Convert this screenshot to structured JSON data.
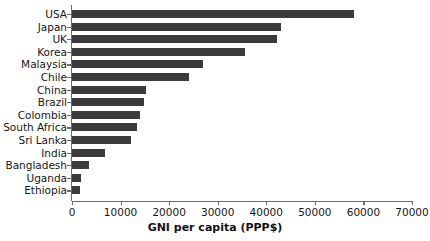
{
  "chart_data": {
    "type": "bar",
    "orientation": "horizontal",
    "title": "",
    "xlabel": "GNI per capita (PPP$)",
    "ylabel": "",
    "xlim": [
      0,
      70000
    ],
    "xticks": [
      0,
      10000,
      20000,
      30000,
      40000,
      50000,
      60000,
      70000
    ],
    "xtick_labels": [
      "0",
      "10000",
      "20000",
      "30000",
      "40000",
      "50000",
      "60000",
      "70000"
    ],
    "grid": false,
    "legend": false,
    "bar_color": "#3b3b3b",
    "axis_color": "#6b6b6b",
    "categories": [
      "USA",
      "Japan",
      "UK",
      "Korea",
      "Malaysia",
      "Chile",
      "China",
      "Brazil",
      "Colombia",
      "South Africa",
      "Sri Lanka",
      "India",
      "Bangladesh",
      "Uganda",
      "Ethiopia"
    ],
    "values": [
      58000,
      43000,
      42200,
      35600,
      27000,
      24000,
      15200,
      14800,
      14000,
      13300,
      12200,
      6800,
      3400,
      1800,
      1700
    ]
  }
}
